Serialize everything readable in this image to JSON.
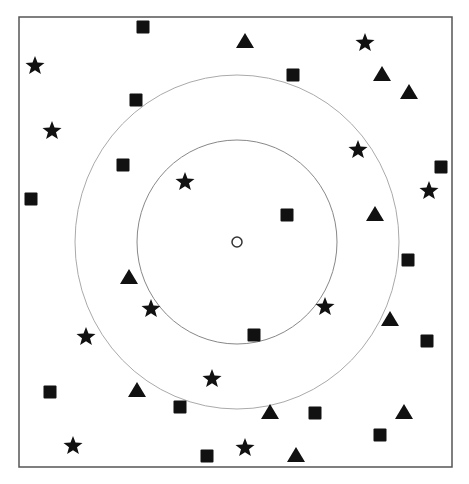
{
  "diagram": {
    "frame": {
      "x": 19,
      "y": 17,
      "width": 433,
      "height": 450,
      "stroke": "#555555"
    },
    "center": {
      "x": 237,
      "y": 242,
      "r": 5,
      "label": "query-point"
    },
    "rings": [
      {
        "name": "inner-ring",
        "rx": 100,
        "ry": 102,
        "stroke": "#888888"
      },
      {
        "name": "outer-ring",
        "rx": 162,
        "ry": 167,
        "stroke": "#aaaaaa"
      }
    ],
    "marker_color": "#111111",
    "squares": [
      [
        143,
        27
      ],
      [
        293,
        75
      ],
      [
        136,
        100
      ],
      [
        123,
        165
      ],
      [
        441,
        167
      ],
      [
        31,
        199
      ],
      [
        287,
        215
      ],
      [
        408,
        260
      ],
      [
        254,
        335
      ],
      [
        427,
        341
      ],
      [
        50,
        392
      ],
      [
        180,
        407
      ],
      [
        315,
        413
      ],
      [
        380,
        435
      ],
      [
        207,
        456
      ]
    ],
    "triangles": [
      [
        245,
        41
      ],
      [
        382,
        74
      ],
      [
        409,
        92
      ],
      [
        375,
        214
      ],
      [
        129,
        277
      ],
      [
        390,
        319
      ],
      [
        137,
        390
      ],
      [
        270,
        412
      ],
      [
        404,
        412
      ],
      [
        296,
        455
      ]
    ],
    "stars": [
      [
        365,
        43
      ],
      [
        35,
        66
      ],
      [
        52,
        131
      ],
      [
        358,
        150
      ],
      [
        429,
        191
      ],
      [
        185,
        182
      ],
      [
        151,
        309
      ],
      [
        325,
        307
      ],
      [
        86,
        337
      ],
      [
        212,
        379
      ],
      [
        73,
        446
      ],
      [
        245,
        448
      ]
    ]
  }
}
